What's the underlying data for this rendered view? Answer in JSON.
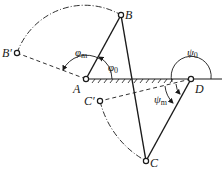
{
  "diagram": {
    "type": "four-bar-linkage-extreme-positions",
    "colors": {
      "ink": "#1a1a1a",
      "background": "#ffffff"
    },
    "points": {
      "A": {
        "label": "A",
        "x": 86,
        "y": 79
      },
      "B": {
        "label": "B",
        "x": 121,
        "y": 15
      },
      "B_prime": {
        "label": "B′",
        "x": 17,
        "y": 53
      },
      "C": {
        "label": "C",
        "x": 146,
        "y": 161
      },
      "C_prime": {
        "label": "C′",
        "x": 100,
        "y": 101
      },
      "D": {
        "label": "D",
        "x": 191,
        "y": 79
      }
    },
    "angles": {
      "phi_m": {
        "symbol": "φ",
        "subscript": "m"
      },
      "phi_0": {
        "symbol": "φ",
        "subscript": "0"
      },
      "psi_0": {
        "symbol": "ψ",
        "subscript": "0"
      },
      "psi_m": {
        "symbol": "ψ",
        "subscript": "m"
      }
    },
    "ground_line": {
      "from_x": 86,
      "to_x": 222,
      "y": 79,
      "hatched_from": 86,
      "hatched_to": 191
    }
  }
}
